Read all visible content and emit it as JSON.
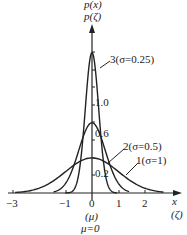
{
  "chart_data": {
    "type": "line",
    "title": "",
    "xlabel": "x (ζ)",
    "ylabel": "p(x) p(ζ)",
    "xlim": [
      -3.3,
      2.9
    ],
    "ylim": [
      0,
      1.75
    ],
    "grid": false,
    "x_ticks": [
      "-3",
      "-1",
      "0",
      "1",
      "2"
    ],
    "y_ticks": [
      "0.2",
      "0.6",
      "1.0"
    ],
    "annotations": [
      "(μ)",
      "μ=0"
    ],
    "series": [
      {
        "name": "1(σ=1)",
        "sigma": 1,
        "mu": 0,
        "peak": 0.399
      },
      {
        "name": "2(σ=0.5)",
        "sigma": 0.5,
        "mu": 0,
        "peak": 0.798
      },
      {
        "name": "3(σ=0.25)",
        "sigma": 0.25,
        "mu": 0,
        "peak": 1.596
      }
    ]
  },
  "labels": {
    "ylabel_top": "p(x)",
    "ylabel_bottom": "p(ζ)",
    "xlabel_top": "x",
    "xlabel_bottom": "(ζ)",
    "mu_paren": "(μ)",
    "mu_eq": "μ=0",
    "curve1": "1(σ=1)",
    "curve2": "2(σ=0.5)",
    "curve3": "3(σ=0.25)",
    "ytick_02": "0.2",
    "ytick_06": "0.6",
    "ytick_10": "1.0",
    "xtick_m3": "−3",
    "xtick_m1": "−1",
    "xtick_0": "0",
    "xtick_1": "1",
    "xtick_2": "2"
  }
}
